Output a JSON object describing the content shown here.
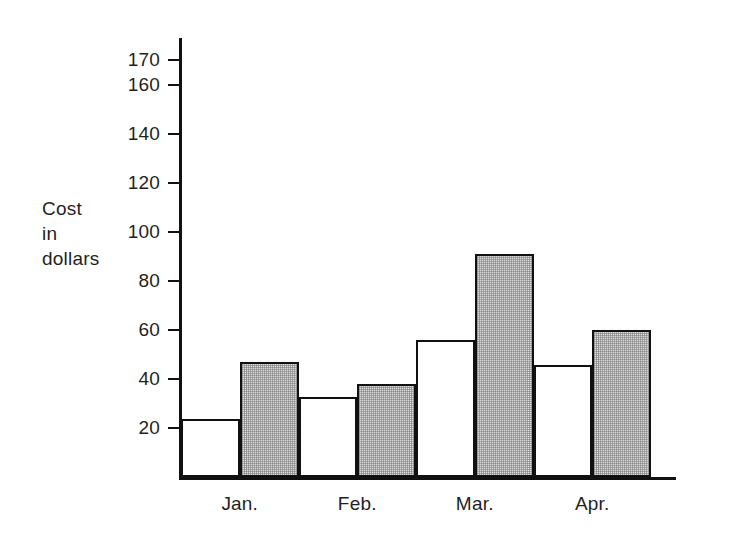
{
  "chart_data": {
    "type": "bar",
    "title": "",
    "subtitle": "",
    "xlabel": "",
    "ylabel": "Cost\nin\ndollars",
    "ylabel_lines": [
      "Cost",
      "in",
      "dollars"
    ],
    "categories": [
      "Jan.",
      "Feb.",
      "Mar.",
      "Apr."
    ],
    "series": [
      {
        "name": "white-bar",
        "fill": "white",
        "values": [
          24,
          33,
          56,
          46
        ]
      },
      {
        "name": "shaded-bar",
        "fill": "gray-stipple",
        "values": [
          47,
          38,
          91,
          60
        ]
      }
    ],
    "ylim": [
      0,
      177
    ],
    "ytick_labels": [
      "20",
      "40",
      "60",
      "80",
      "100",
      "120",
      "140",
      "160",
      "170"
    ],
    "ytick_values": [
      20,
      40,
      60,
      80,
      100,
      120,
      140,
      160,
      170
    ],
    "grid": false,
    "legend": "none",
    "annotations": []
  },
  "axis": {
    "y_title_lines": [
      "Cost",
      "in",
      "dollars"
    ]
  },
  "colors": {
    "line": "#111111",
    "plain_fill": "#ffffff",
    "shaded_fill": "#dcdcdc",
    "background": "#ffffff",
    "text": "#1f1f1f"
  }
}
